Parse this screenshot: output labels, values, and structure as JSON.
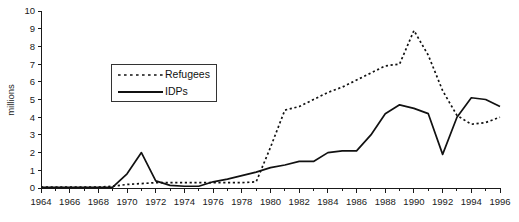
{
  "chart_data": {
    "type": "line",
    "title": "",
    "subtitle": "",
    "xlabel": "",
    "ylabel": "millions",
    "xlim": [
      1964,
      1996
    ],
    "ylim": [
      0,
      10
    ],
    "y_ticks": [
      0,
      1,
      2,
      3,
      4,
      5,
      6,
      7,
      8,
      9,
      10
    ],
    "y_tick_labels": [
      "0",
      "1",
      "2",
      "3",
      "4",
      "5",
      "6",
      "7",
      "8",
      "9",
      "10"
    ],
    "x_ticks": [
      1964,
      1966,
      1968,
      1970,
      1972,
      1974,
      1976,
      1978,
      1980,
      1982,
      1984,
      1986,
      1988,
      1990,
      1992,
      1994,
      1996
    ],
    "x_tick_labels": [
      "1964",
      "1966",
      "1968",
      "1970",
      "1972",
      "1974",
      "1976",
      "1978",
      "1980",
      "1982",
      "1984",
      "1986",
      "1988",
      "1990",
      "1992",
      "1994",
      "1996"
    ],
    "x_minor_tick_interval": 1,
    "grid": false,
    "legend_position": "upper-left-inside",
    "x": [
      1964,
      1965,
      1966,
      1967,
      1968,
      1969,
      1970,
      1971,
      1972,
      1973,
      1974,
      1975,
      1976,
      1977,
      1978,
      1979,
      1980,
      1981,
      1982,
      1983,
      1984,
      1985,
      1986,
      1987,
      1988,
      1989,
      1990,
      1991,
      1992,
      1993,
      1994,
      1995,
      1996
    ],
    "series": [
      {
        "name": "Refugees",
        "style": "dotted",
        "color": "#111111",
        "values": [
          0.05,
          0.05,
          0.05,
          0.05,
          0.05,
          0.1,
          0.2,
          0.25,
          0.3,
          0.3,
          0.3,
          0.3,
          0.3,
          0.3,
          0.3,
          0.35,
          2.3,
          4.4,
          4.6,
          5.0,
          5.4,
          5.7,
          6.1,
          6.5,
          6.9,
          7.0,
          8.9,
          7.5,
          5.5,
          4.1,
          3.6,
          3.7,
          4.0
        ]
      },
      {
        "name": "IDPs",
        "style": "solid",
        "color": "#111111",
        "values": [
          0.03,
          0.03,
          0.03,
          0.03,
          0.03,
          0.05,
          0.8,
          2.0,
          0.4,
          0.15,
          0.1,
          0.1,
          0.35,
          0.5,
          0.7,
          0.9,
          1.15,
          1.3,
          1.5,
          1.5,
          2.0,
          2.1,
          2.1,
          3.0,
          4.2,
          4.7,
          4.5,
          4.2,
          1.9,
          4.0,
          5.1,
          5.0,
          4.6
        ]
      }
    ]
  },
  "legend": {
    "entries": [
      {
        "label": "Refugees",
        "style": "dotted"
      },
      {
        "label": "IDPs",
        "style": "solid"
      }
    ]
  }
}
